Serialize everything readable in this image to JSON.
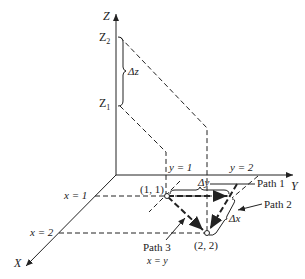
{
  "diagram": {
    "axes": {
      "x": "X",
      "y": "Y",
      "z": "Z"
    },
    "z_labels": {
      "z2": "Z",
      "z2_sub": "2",
      "z1": "Z",
      "z1_sub": "1",
      "delta_z": "Δz"
    },
    "y_labels": {
      "y1": "y = 1",
      "y2": "y = 2",
      "delta_y": "Δy"
    },
    "x_labels": {
      "x1": "x = 1",
      "x2": "x = 2",
      "delta_x": "Δx"
    },
    "points": {
      "p11": "(1, 1)",
      "p22": "(2, 2)"
    },
    "paths": {
      "path1": "Path 1",
      "path2": "Path 2",
      "path3": "Path 3",
      "path3_eq": "x = y"
    },
    "colors": {
      "line": "#222222",
      "background": "#ffffff"
    }
  }
}
